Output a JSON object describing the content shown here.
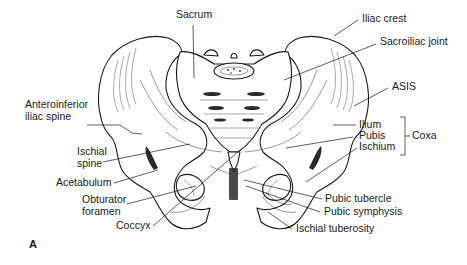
{
  "figure": {
    "panel_label": "A",
    "labels": {
      "sacrum": "Sacrum",
      "iliac_crest": "Iliac crest",
      "sacroiliac_joint": "Sacroiliac joint",
      "asis": "ASIS",
      "anteroinferior_iliac_spine_1": "Anteroinferior",
      "anteroinferior_iliac_spine_2": "iliac spine",
      "ischial_spine_1": "Ischial",
      "ischial_spine_2": "spine",
      "acetabulum": "Acetabulum",
      "obturator_foramen_1": "Obturator",
      "obturator_foramen_2": "foramen",
      "coccyx": "Coccyx",
      "ilium": "Ilium",
      "pubis": "Pubis",
      "ischium": "Ischium",
      "coxa": "Coxa",
      "pubic_tubercle": "Pubic tubercle",
      "pubic_symphysis": "Pubic symphysis",
      "ischial_tuberosity": "Ischial tuberosity"
    }
  }
}
